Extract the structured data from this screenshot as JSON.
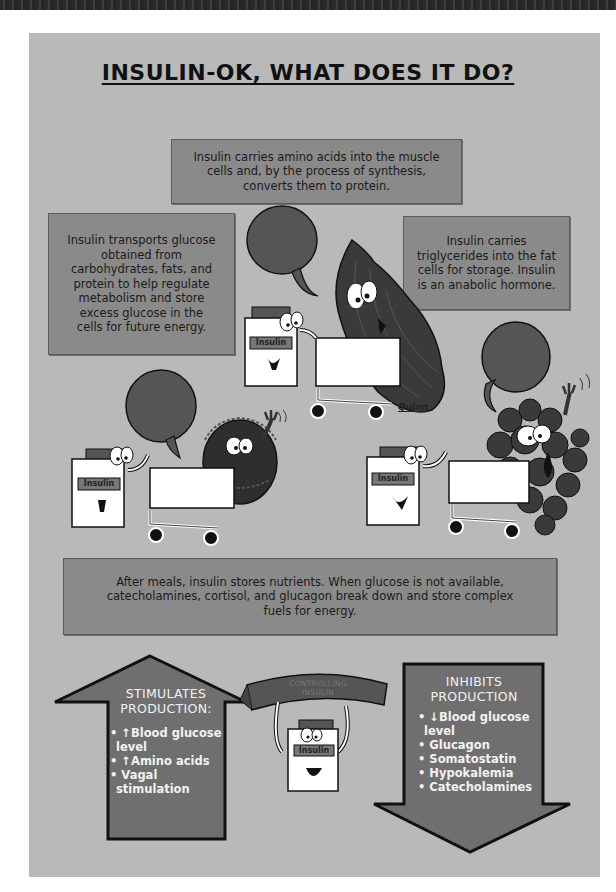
{
  "poster": {
    "title": "INSULIN-OK, WHAT DOES IT DO?",
    "colors": {
      "panel_background": "#b9b9b9",
      "text_box_fill": "#8a8a8a",
      "arrow_fill": "#6f6f6f",
      "arrow_text": "#f2f2f2",
      "outline": "#111111"
    },
    "boxes": {
      "muscle_protein": {
        "lines": [
          "Insulin carries amino acids into the muscle",
          "cells and, by the process of synthesis,",
          "converts them to protein."
        ]
      },
      "glucose": {
        "lines": [
          "Insulin transports glucose",
          "obtained from",
          "carbohydrates, fats, and",
          "protein to help regulate",
          "metabolism and store",
          "excess glucose in the",
          "cells for future energy."
        ]
      },
      "triglycerides": {
        "lines": [
          "Insulin carries",
          "triglycerides into the fat",
          "cells for storage.  Insulin",
          "is an anabolic hormone."
        ]
      },
      "after_meals": {
        "lines": [
          "After meals, insulin stores nutrients. When glucose is not available,",
          "catecholamines, cortisol, and glucagon break down and store complex",
          "fuels for energy."
        ]
      }
    },
    "speech_bubbles": {
      "muscle": [
        "I'm a",
        "muscle",
        "cell."
      ],
      "tissue": [
        "I'm a",
        "tissue",
        "cell."
      ],
      "adipose": [
        "I'm an",
        "adipose",
        "cell."
      ]
    },
    "insulin_label": "Insulin",
    "signature": "Quinn",
    "stimulates": {
      "heading": [
        "STIMULATES",
        "PRODUCTION:"
      ],
      "items": [
        "• ↑Blood glucose",
        "  level",
        "• ↑Amino acids",
        "• Vagal",
        "  stimulation"
      ]
    },
    "controlling_banner": [
      "CONTROLLING",
      "INSULIN"
    ],
    "inhibits": {
      "heading": [
        "INHIBITS",
        "PRODUCTION"
      ],
      "items": [
        "• ↓Blood glucose",
        "  level",
        "• Glucagon",
        "• Somatostatin",
        "• Hypokalemia",
        "• Catecholamines"
      ]
    }
  }
}
